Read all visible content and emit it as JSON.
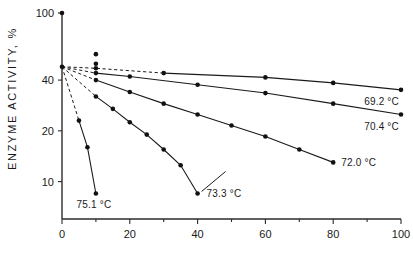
{
  "chart_data": {
    "type": "line",
    "title": "",
    "xlabel": "",
    "ylabel": "ENZYME ACTIVITY, %",
    "y_scale": "log",
    "x_scale": "linear",
    "xlim": [
      0,
      100
    ],
    "ylim": [
      6,
      100
    ],
    "grid": false,
    "legend_position": "line-end-labels",
    "xticks": [
      0,
      20,
      40,
      60,
      80,
      100
    ],
    "xtick_labels": [
      "0",
      "20",
      "40",
      "60",
      "80",
      "100"
    ],
    "x_minor_ticks": [
      10,
      30,
      50,
      70,
      90
    ],
    "yticks": [
      100,
      40,
      20,
      10
    ],
    "ytick_labels": [
      "100",
      "40",
      "20",
      "10"
    ],
    "series": [
      {
        "name": "69.2 °C",
        "label": "69.2 °C",
        "temperature_c": 69.2,
        "x": [
          0,
          10,
          30,
          60,
          80,
          100
        ],
        "values": [
          48,
          47,
          44,
          41.5,
          38.5,
          35
        ],
        "dashed_to_x": 30
      },
      {
        "name": "70.4 °C",
        "label": "70.4 °C",
        "temperature_c": 70.4,
        "x": [
          0,
          10,
          20,
          40,
          60,
          80,
          100
        ],
        "values": [
          48,
          44,
          42,
          37.5,
          33.5,
          29,
          25
        ],
        "dashed_to_x": 10
      },
      {
        "name": "72.0 °C",
        "label": "72.0 °C",
        "temperature_c": 72.0,
        "x": [
          0,
          10,
          20,
          30,
          40,
          50,
          60,
          70,
          80
        ],
        "values": [
          48,
          40,
          34,
          29,
          25,
          21.5,
          18.5,
          15.5,
          13
        ],
        "dashed_to_x": 10
      },
      {
        "name": "73.3 °C",
        "label": "73.3 °C",
        "temperature_c": 73.3,
        "x": [
          0,
          10,
          15,
          20,
          25,
          30,
          35,
          40
        ],
        "values": [
          48,
          32,
          27,
          22.5,
          19,
          15.5,
          12.5,
          8.5
        ],
        "dashed_to_x": 10
      },
      {
        "name": "75.1 °C",
        "label": "75.1 °C",
        "temperature_c": 75.1,
        "x": [
          0,
          5,
          7.5,
          10
        ],
        "values": [
          48,
          23,
          16,
          8.5
        ],
        "dashed_to_x": 5
      }
    ],
    "extra_points": [
      {
        "name": "origin-100-point",
        "x": 0,
        "y": 100
      },
      {
        "name": "outlier-point",
        "x": 10,
        "y": 57
      },
      {
        "name": "upper-cluster-point",
        "x": 10,
        "y": 50
      }
    ],
    "annotations": [
      {
        "name": "label-69",
        "text": "69.2 °C",
        "x": 100,
        "y": 35
      },
      {
        "name": "label-70",
        "text": "70.4 °C",
        "x": 100,
        "y": 25
      },
      {
        "name": "label-72",
        "text": "72.0 °C",
        "x": 80,
        "y": 13
      },
      {
        "name": "label-73",
        "text": "73.3 °C",
        "x": 40,
        "y": 8.5,
        "leader": true
      },
      {
        "name": "label-75",
        "text": "75.1 °C",
        "x": 10,
        "y": 8.5
      }
    ]
  },
  "colors": {
    "line": "#1a1a1a",
    "axis": "#2b2b2b",
    "marker": "#111111",
    "background": "#ffffff"
  }
}
